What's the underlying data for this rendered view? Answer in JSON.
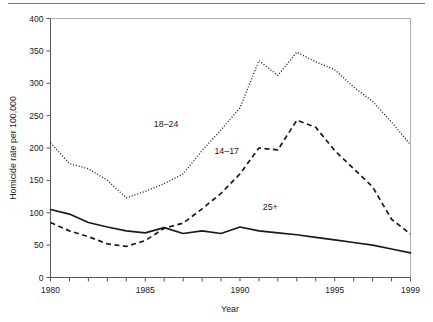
{
  "chart_data": {
    "type": "line",
    "title": "",
    "xlabel": "Year",
    "ylabel": "Homicide rate per 100,000",
    "xlim": [
      1980,
      1999
    ],
    "ylim": [
      0,
      400
    ],
    "grid": false,
    "legend_position": "inline-annotations",
    "x": [
      1980,
      1981,
      1982,
      1983,
      1984,
      1985,
      1986,
      1987,
      1988,
      1989,
      1990,
      1991,
      1992,
      1993,
      1994,
      1995,
      1996,
      1997,
      1998,
      1999
    ],
    "x_tick_labels": [
      "1980",
      "1985",
      "1990",
      "1995",
      "1999"
    ],
    "x_tick_values": [
      1980,
      1985,
      1990,
      1995,
      1999
    ],
    "y_tick_labels": [
      "0",
      "50",
      "100",
      "150",
      "200",
      "250",
      "300",
      "350",
      "400"
    ],
    "y_tick_values": [
      0,
      50,
      100,
      150,
      200,
      250,
      300,
      350,
      400
    ],
    "series": [
      {
        "name": "18-24",
        "label": "18–24",
        "style": "dotted",
        "color": "#1a1a1a",
        "values": [
          208,
          176,
          168,
          150,
          123,
          133,
          145,
          160,
          196,
          228,
          262,
          335,
          312,
          348,
          333,
          321,
          294,
          272,
          240,
          205
        ]
      },
      {
        "name": "14-17",
        "label": "14–17",
        "style": "dashed",
        "color": "#1a1a1a",
        "values": [
          85,
          72,
          63,
          52,
          48,
          57,
          76,
          84,
          106,
          130,
          160,
          200,
          197,
          243,
          232,
          196,
          168,
          140,
          90,
          67
        ]
      },
      {
        "name": "25+",
        "label": "25+",
        "style": "solid",
        "color": "#1a1a1a",
        "values": [
          105,
          98,
          85,
          78,
          72,
          69,
          77,
          68,
          72,
          68,
          78,
          72,
          69,
          66,
          62,
          58,
          54,
          50,
          44,
          38
        ]
      }
    ],
    "annotations": [
      {
        "text": "18–24",
        "x": 1986.1,
        "y": 232
      },
      {
        "text": "14–17",
        "x": 1989.3,
        "y": 190
      },
      {
        "text": "25+",
        "x": 1991.6,
        "y": 104
      }
    ]
  }
}
